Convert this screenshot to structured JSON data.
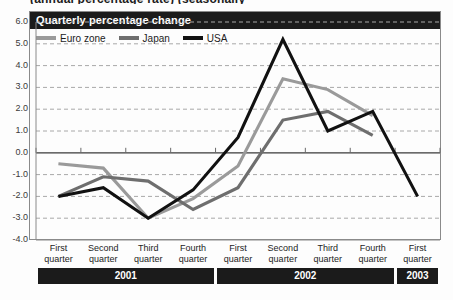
{
  "headline": "(annual percentage rate) (seasonally",
  "panel": {
    "title": "Quarterly percentage change"
  },
  "legend": {
    "position": "top-left",
    "items": [
      {
        "label": "Euro zone",
        "color": "#9a9a9a",
        "name": "euro-zone"
      },
      {
        "label": "Japan",
        "color": "#6e6e6e",
        "name": "japan"
      },
      {
        "label": "USA",
        "color": "#111111",
        "name": "usa"
      }
    ]
  },
  "axis": {
    "y_ticks": [
      "6.0",
      "5.0",
      "4.0",
      "3.0",
      "2.0",
      "1.0",
      "0.0",
      "-1.0",
      "-2.0",
      "-3.0",
      "-4.0"
    ],
    "zero_line": "0.0"
  },
  "x_axis": {
    "quarters": [
      {
        "l1": "First",
        "l2": "quarter"
      },
      {
        "l1": "Second",
        "l2": "quarter"
      },
      {
        "l1": "Third",
        "l2": "quarter"
      },
      {
        "l1": "Fourth",
        "l2": "quarter"
      },
      {
        "l1": "First",
        "l2": "quarter"
      },
      {
        "l1": "Second",
        "l2": "quarter"
      },
      {
        "l1": "Third",
        "l2": "quarter"
      },
      {
        "l1": "Fourth",
        "l2": "quarter"
      },
      {
        "l1": "First",
        "l2": "quarter"
      }
    ],
    "years": [
      {
        "label": "2001",
        "span": 4
      },
      {
        "label": "2002",
        "span": 4
      },
      {
        "label": "2003",
        "span": 1
      }
    ]
  },
  "chart_data": {
    "type": "line",
    "title": "Quarterly percentage change",
    "xlabel": "",
    "ylabel": "",
    "ylim": [
      -4.0,
      6.0
    ],
    "ytick_step": 1.0,
    "grid": true,
    "grid_style": "dashed-horizontal",
    "zero_line": 0.0,
    "legend_position": "top-left",
    "categories": [
      "2001 First quarter",
      "2001 Second quarter",
      "2001 Third quarter",
      "2001 Fourth quarter",
      "2002 First quarter",
      "2002 Second quarter",
      "2002 Third quarter",
      "2002 Fourth quarter",
      "2003 First quarter"
    ],
    "series": [
      {
        "name": "Euro zone",
        "color": "#9a9a9a",
        "values": [
          -0.5,
          -0.7,
          -3.0,
          -2.1,
          -0.6,
          3.4,
          2.9,
          1.7,
          null
        ]
      },
      {
        "name": "Japan",
        "color": "#6e6e6e",
        "values": [
          -2.0,
          -1.1,
          -1.3,
          -2.6,
          -1.6,
          1.5,
          1.9,
          0.8,
          null
        ]
      },
      {
        "name": "USA",
        "color": "#111111",
        "values": [
          -2.0,
          -1.6,
          -3.0,
          -1.7,
          0.7,
          5.2,
          1.0,
          1.9,
          -2.0
        ]
      }
    ]
  }
}
